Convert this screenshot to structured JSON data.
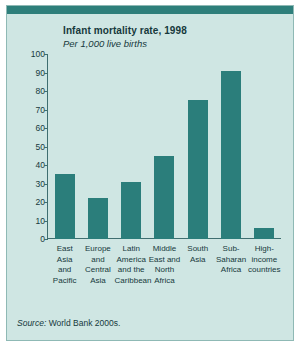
{
  "chart_data": {
    "type": "bar",
    "title": "Infant mortality rate, 1998",
    "subtitle": "Per 1,000 live births",
    "xlabel": "",
    "ylabel": "",
    "ylim": [
      0,
      100
    ],
    "yticks": [
      "100",
      "90",
      "80",
      "70",
      "60",
      "50",
      "40",
      "30",
      "20",
      "10",
      "0"
    ],
    "grid": false,
    "legend": "none",
    "bar_color": "#2b7e7b",
    "categories": [
      "East Asia and Pacific",
      "Europe and Central Asia",
      "Latin America and the Caribbean",
      "Middle East and North Africa",
      "South Asia",
      "Sub-Saharan Africa",
      "High-income countries"
    ],
    "category_lines": [
      [
        "East",
        "Asia",
        "and",
        "Pacific"
      ],
      [
        "Europe",
        "and",
        "Central",
        "Asia"
      ],
      [
        "Latin",
        "America",
        "and the",
        "Caribbean"
      ],
      [
        "Middle",
        "East and",
        "North",
        "Africa"
      ],
      [
        "South",
        "Asia"
      ],
      [
        "Sub-",
        "Saharan",
        "Africa"
      ],
      [
        "High-",
        "income",
        "countries"
      ]
    ],
    "values": [
      35,
      22,
      31,
      45,
      75,
      91,
      6
    ],
    "source": "World Bank 2000s.",
    "source_prefix": "Source:"
  }
}
